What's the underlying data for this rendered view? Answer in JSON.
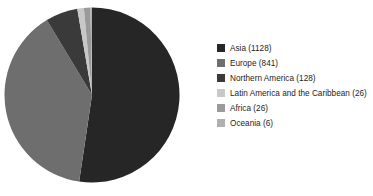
{
  "chart_data": {
    "type": "pie",
    "title": "",
    "subtitle": "",
    "xlabel": "",
    "ylabel": "",
    "grid": false,
    "legend_position": "right",
    "total": 2155,
    "start_angle_deg": 0,
    "direction": "clockwise",
    "categories": [
      "Asia",
      "Europe",
      "Northern America",
      "Latin America and the Caribbean",
      "Africa",
      "Oceania"
    ],
    "values": [
      1128,
      841,
      128,
      26,
      26,
      6
    ],
    "percents": [
      52.3,
      39.0,
      5.9,
      1.2,
      1.2,
      0.3
    ],
    "colors": [
      "#262626",
      "#6e6e6e",
      "#3a3a3a",
      "#c8c8c8",
      "#9a9a9a",
      "#b0b0b0"
    ],
    "slices": [
      {
        "label": "Asia",
        "value": 1128,
        "percent": 52.3,
        "color": "#262626"
      },
      {
        "label": "Europe",
        "value": 841,
        "percent": 39.0,
        "color": "#6e6e6e"
      },
      {
        "label": "Northern America",
        "value": 128,
        "percent": 5.9,
        "color": "#3a3a3a"
      },
      {
        "label": "Latin America and the Caribbean",
        "value": 26,
        "percent": 1.2,
        "color": "#c8c8c8"
      },
      {
        "label": "Africa",
        "value": 26,
        "percent": 1.2,
        "color": "#9a9a9a"
      },
      {
        "label": "Oceania",
        "value": 6,
        "percent": 0.3,
        "color": "#b0b0b0"
      }
    ]
  },
  "legend": {
    "items": [
      {
        "label": "Asia (1128)",
        "color": "#262626"
      },
      {
        "label": "Europe (841)",
        "color": "#6e6e6e"
      },
      {
        "label": "Northern America (128)",
        "color": "#3a3a3a"
      },
      {
        "label": "Latin America and the Caribbean (26)",
        "color": "#c8c8c8"
      },
      {
        "label": "Africa (26)",
        "color": "#9a9a9a"
      },
      {
        "label": "Oceania (6)",
        "color": "#b0b0b0"
      }
    ]
  }
}
